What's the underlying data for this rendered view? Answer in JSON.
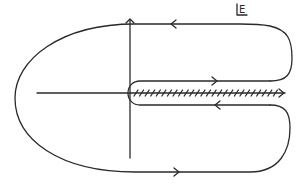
{
  "diagram": {
    "type": "contour-integration",
    "plane_label": "E",
    "axes": {
      "real_axis": {
        "x1": 37,
        "x2": 285,
        "y": 93
      },
      "imag_axis": {
        "x": 130,
        "y1": 20,
        "y2": 158
      }
    },
    "branch_cut": {
      "from_x": 132,
      "to_x": 283,
      "y": 93,
      "hatch_count": 26,
      "arrow_direction": "right"
    },
    "contour": {
      "segments": [
        {
          "name": "top-line",
          "direction": "left",
          "arrow_at": [
            172,
            24
          ]
        },
        {
          "name": "upper-cut-line",
          "direction": "right",
          "arrow_at": [
            215,
            81
          ]
        },
        {
          "name": "lower-cut-line",
          "direction": "left",
          "arrow_at": [
            217,
            105
          ]
        },
        {
          "name": "bottom-line",
          "direction": "right",
          "arrow_at": [
            176,
            172
          ]
        }
      ]
    },
    "color": "#2a2a2a"
  }
}
